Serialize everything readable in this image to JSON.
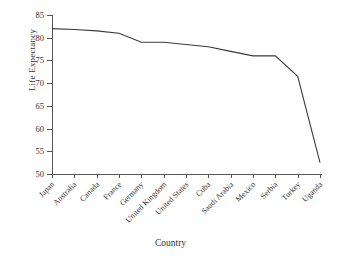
{
  "chart_data": {
    "type": "line",
    "title": "",
    "xlabel": "Country",
    "ylabel": "Life Expectancy",
    "categories": [
      "Japan",
      "Australia",
      "Canada",
      "France",
      "Germany",
      "United Kingdom",
      "United States",
      "Cuba",
      "Saudi Arabia",
      "Mexico",
      "Serbia",
      "Turkey",
      "Uganda"
    ],
    "values": [
      82.0,
      81.8,
      81.5,
      81.0,
      79.0,
      79.0,
      78.5,
      78.0,
      77.0,
      76.0,
      76.0,
      71.5,
      52.5
    ],
    "series": [
      {
        "name": "Life Expectancy",
        "values": [
          82.0,
          81.8,
          81.5,
          81.0,
          79.0,
          79.0,
          78.5,
          78.0,
          77.0,
          76.0,
          76.0,
          71.5,
          52.5
        ]
      }
    ],
    "ylim": [
      50,
      85
    ],
    "yticks": [
      50,
      55,
      60,
      65,
      70,
      75,
      80,
      85
    ],
    "ytick_labels": [
      "50",
      "55",
      "60",
      "65",
      "70",
      "75",
      "80",
      "85"
    ],
    "grid": false,
    "legend": false,
    "legend_position": "none",
    "line_color": "#3a3a3a",
    "background_color": "#ffffff",
    "axis_color": "#555555",
    "xtick_rotation": -45
  }
}
